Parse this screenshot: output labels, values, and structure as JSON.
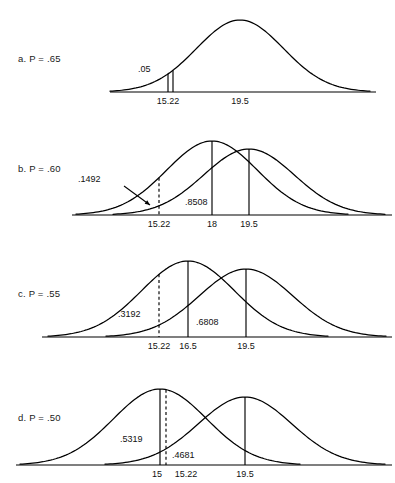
{
  "figure": {
    "type": "statistical-distribution-diagram",
    "background_color": "#ffffff",
    "stroke_color": "#000000",
    "panel_count": 4
  },
  "panels": [
    {
      "id": "a",
      "label": "a.  P  =  .65",
      "p_value": 0.65,
      "curves": [
        {
          "name": "alternative",
          "mean_tick": "19.5",
          "mean_value": 19.5,
          "peak_x": 240,
          "half_width": 130,
          "height": 72
        }
      ],
      "critical_lines": [
        {
          "tick": "15.22",
          "value": 15.22,
          "style": "solid",
          "x": 168
        },
        {
          "tick": "",
          "value": 15.22,
          "style": "solid",
          "x": 173
        }
      ],
      "ticks": [
        {
          "label": "15.22",
          "x": 168
        },
        {
          "label": "19.5",
          "x": 240
        }
      ],
      "area_labels": [
        {
          "text": ".05",
          "x": 138,
          "y": 72
        }
      ],
      "baseline": {
        "x1": 110,
        "x2": 376,
        "y": 92
      }
    },
    {
      "id": "b",
      "label": "b.  P  =  .60",
      "p_value": 0.6,
      "curves": [
        {
          "name": "null",
          "mean_tick": "18",
          "mean_value": 18,
          "peak_x": 212,
          "half_width": 136,
          "height": 74
        },
        {
          "name": "alternative",
          "mean_tick": "19.5",
          "mean_value": 19.5,
          "peak_x": 249,
          "half_width": 136,
          "height": 66
        }
      ],
      "critical_lines": [
        {
          "tick": "15.22",
          "value": 15.22,
          "style": "dashed",
          "x": 159
        },
        {
          "tick": "18",
          "value": 18,
          "style": "solid",
          "x": 212
        },
        {
          "tick": "19.5",
          "value": 19.5,
          "style": "solid",
          "x": 249
        }
      ],
      "ticks": [
        {
          "label": "15.22",
          "x": 159
        },
        {
          "label": "18",
          "x": 212
        },
        {
          "label": "19.5",
          "x": 249
        }
      ],
      "area_labels": [
        {
          "text": ".1492",
          "x": 78,
          "y": 182
        },
        {
          "text": ".8508",
          "x": 185,
          "y": 205
        }
      ],
      "arrow": {
        "x1": 124,
        "y1": 186,
        "x2": 150,
        "y2": 205
      },
      "baseline": {
        "x1": 72,
        "x2": 392,
        "y": 215
      }
    },
    {
      "id": "c",
      "label": "c.  P  =  .55",
      "p_value": 0.55,
      "curves": [
        {
          "name": "null",
          "mean_tick": "16.5",
          "mean_value": 16.5,
          "peak_x": 188,
          "half_width": 140,
          "height": 76
        },
        {
          "name": "alternative",
          "mean_tick": "19.5",
          "mean_value": 19.5,
          "peak_x": 246,
          "half_width": 140,
          "height": 68
        }
      ],
      "critical_lines": [
        {
          "tick": "15.22",
          "value": 15.22,
          "style": "dashed",
          "x": 159
        },
        {
          "tick": "16.5",
          "value": 16.5,
          "style": "solid",
          "x": 188
        },
        {
          "tick": "19.5",
          "value": 19.5,
          "style": "solid",
          "x": 246
        }
      ],
      "ticks": [
        {
          "label": "15.22",
          "x": 159
        },
        {
          "label": "16.5",
          "x": 188
        },
        {
          "label": "19.5",
          "x": 246
        }
      ],
      "area_labels": [
        {
          "text": ".3192",
          "x": 118,
          "y": 317
        },
        {
          "text": ".6808",
          "x": 196,
          "y": 325
        }
      ],
      "baseline": {
        "x1": 42,
        "x2": 392,
        "y": 337
      }
    },
    {
      "id": "d",
      "label": "d.  P  =  .50",
      "p_value": 0.5,
      "curves": [
        {
          "name": "null",
          "mean_tick": "15",
          "mean_value": 15,
          "peak_x": 160,
          "half_width": 140,
          "height": 76
        },
        {
          "name": "alternative",
          "mean_tick": "19.5",
          "mean_value": 19.5,
          "peak_x": 245,
          "half_width": 140,
          "height": 68
        }
      ],
      "critical_lines": [
        {
          "tick": "15",
          "value": 15,
          "style": "solid",
          "x": 160
        },
        {
          "tick": "15.22",
          "value": 15.22,
          "style": "dashed",
          "x": 166
        },
        {
          "tick": "19.5",
          "value": 19.5,
          "style": "solid",
          "x": 245
        }
      ],
      "ticks": [
        {
          "label": "15",
          "x": 157
        },
        {
          "label": "15.22",
          "x": 186
        },
        {
          "label": "19.5",
          "x": 245
        }
      ],
      "area_labels": [
        {
          "text": ".5319",
          "x": 120,
          "y": 442
        },
        {
          "text": ".4681",
          "x": 172,
          "y": 458
        }
      ],
      "baseline": {
        "x1": 16,
        "x2": 392,
        "y": 465
      }
    }
  ],
  "chart_data": {
    "type": "line",
    "title": "",
    "xlabel": "",
    "ylabel": "",
    "series": [
      {
        "name": "a. P = .65 alternative distribution",
        "mean": 19.5,
        "critical_value": 15.22,
        "tail_area": 0.05
      },
      {
        "name": "b. P = .60 null distribution",
        "mean": 18,
        "critical_value": 15.22,
        "lower_area": 0.1492,
        "upper_area": 0.8508
      },
      {
        "name": "b. P = .60 alternative distribution",
        "mean": 19.5
      },
      {
        "name": "c. P = .55 null distribution",
        "mean": 16.5,
        "critical_value": 15.22,
        "lower_area": 0.3192,
        "upper_area": 0.6808
      },
      {
        "name": "c. P = .55 alternative distribution",
        "mean": 19.5
      },
      {
        "name": "d. P = .50 null distribution",
        "mean": 15,
        "critical_value": 15.22,
        "lower_area": 0.5319,
        "upper_area": 0.4681
      },
      {
        "name": "d. P = .50 alternative distribution",
        "mean": 19.5
      }
    ],
    "categories": [
      "15",
      "15.22",
      "16.5",
      "18",
      "19.5"
    ],
    "annotations": [
      ".05",
      ".1492",
      ".8508",
      ".3192",
      ".6808",
      ".5319",
      ".4681"
    ],
    "grid": false,
    "legend": "none"
  }
}
